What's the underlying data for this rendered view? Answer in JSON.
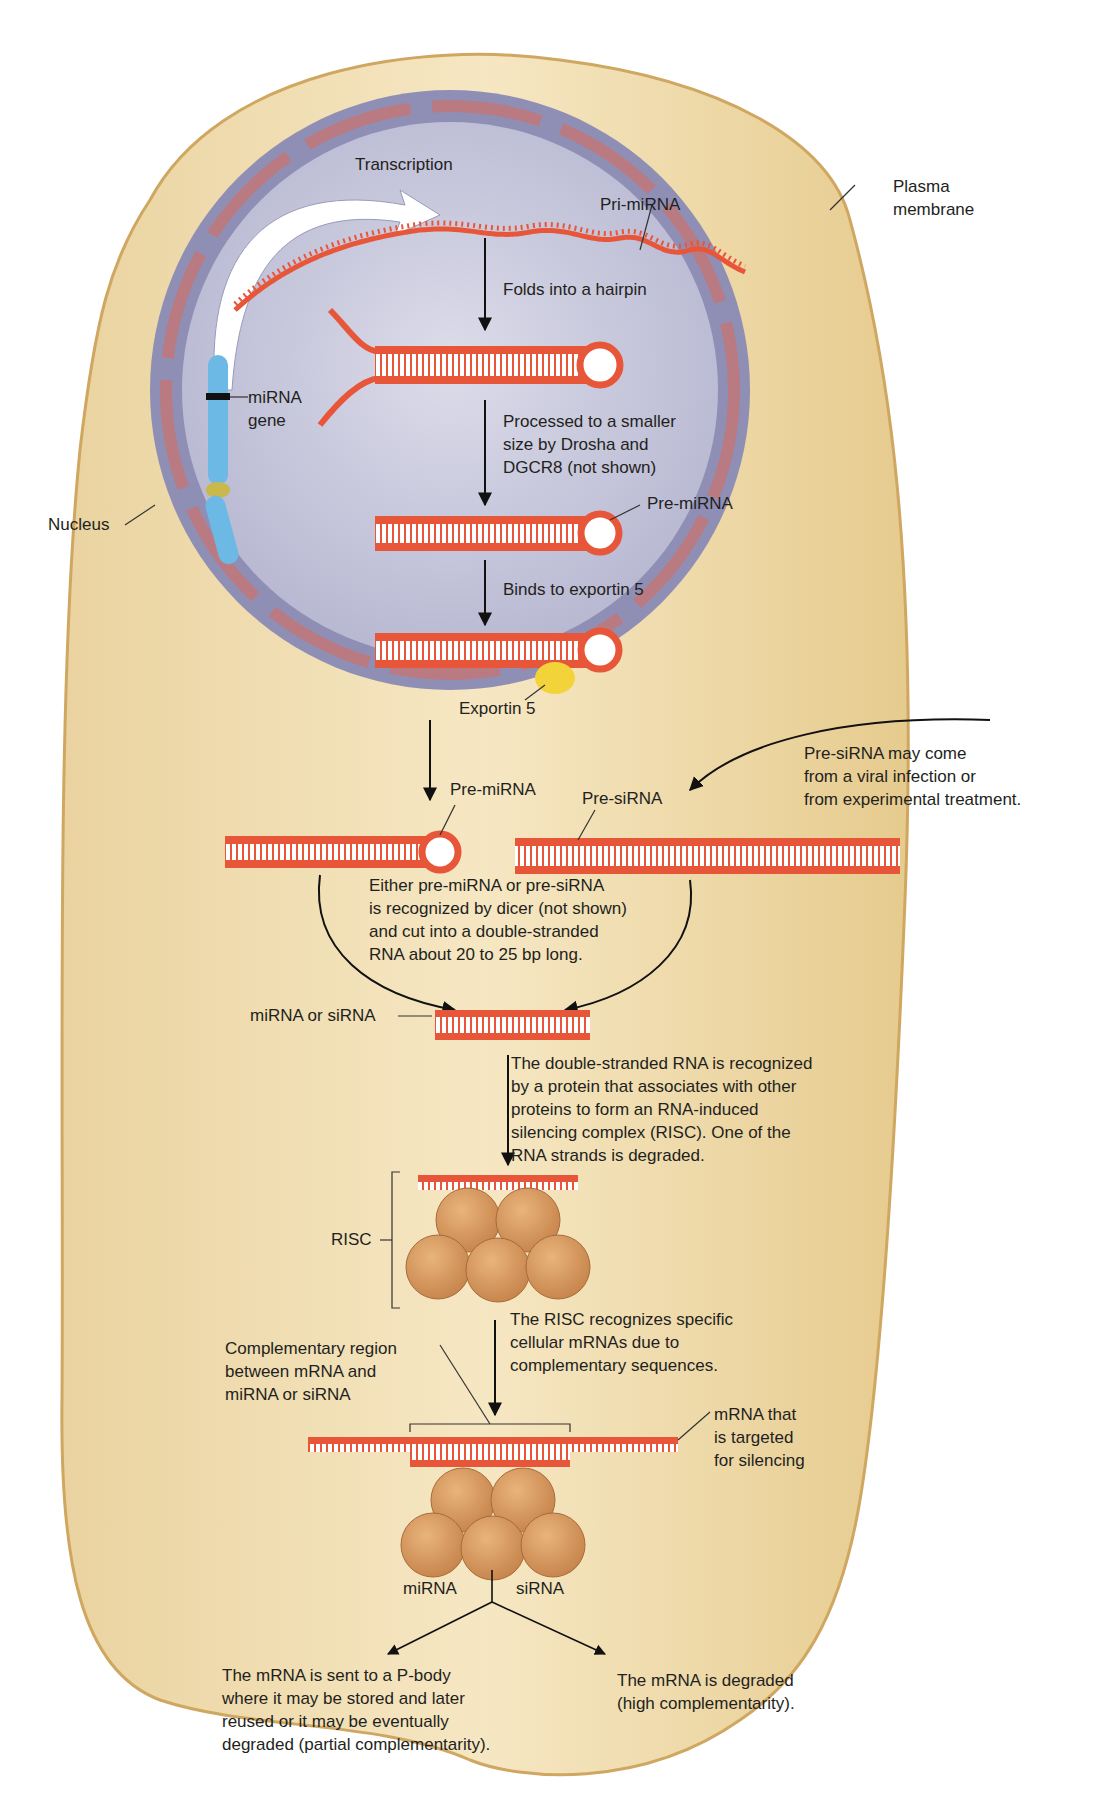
{
  "diagram": {
    "colors": {
      "cytoplasm": "#f1dcaa",
      "cytoplasm_edge": "#d8b46a",
      "nucleus": "#c9c9de",
      "nuclear_envelope": "#8f8fb5",
      "envelope_inner": "#b97a82",
      "rna": "#e8563a",
      "rna_light": "#f59a7c",
      "gene": "#6cb9e5",
      "exportin": "#f2d43a",
      "risc_protein": "#d99a5c",
      "arrow": "#111111"
    },
    "labels": {
      "plasma_membrane": "Plasma\nmembrane",
      "transcription": "Transcription",
      "pri_mirna": "Pri-miRNA",
      "folds": "Folds into a hairpin",
      "mirna_gene": "miRNA\ngene",
      "processed": "Processed to a smaller\nsize by Drosha and\nDGCR8 (not shown)",
      "nucleus": "Nucleus",
      "pre_mirna_nuc": "Pre-miRNA",
      "binds_exportin": "Binds to exportin 5",
      "exportin": "Exportin 5",
      "pre_mirna_cyto": "Pre-miRNA",
      "pre_sirna": "Pre-siRNA",
      "pre_sirna_source": "Pre-siRNA may come\nfrom a viral infection or\nfrom experimental treatment.",
      "dicer": "Either pre-miRNA or pre-siRNA\nis recognized by dicer (not shown)\nand cut into a double-stranded\nRNA about 20 to 25 bp long.",
      "mirna_or_sirna": "miRNA or siRNA",
      "risc_forms": "The double-stranded RNA is recognized\nby a protein that associates with other\nproteins to form an RNA-induced\nsilencing complex (RISC). One of the\nRNA strands is degraded.",
      "risc": "RISC",
      "risc_recognizes": "The RISC recognizes specific\ncellular mRNAs due to\ncomplementary sequences.",
      "complementary_region": "Complementary region\nbetween mRNA and\nmiRNA or siRNA",
      "mrna_targeted": "mRNA that\nis targeted\nfor silencing",
      "branch_mirna": "miRNA",
      "branch_sirna": "siRNA",
      "outcome_mirna": "The mRNA is sent to a P-body\nwhere it may be stored and later\nreused or it may be eventually\ndegraded (partial complementarity).",
      "outcome_sirna": "The mRNA is degraded\n(high complementarity)."
    }
  }
}
